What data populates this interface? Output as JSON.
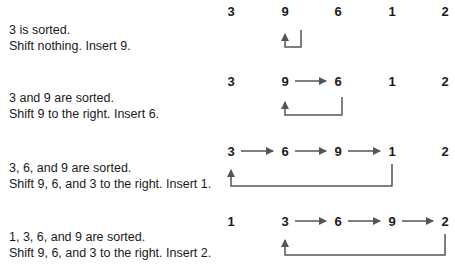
{
  "arrow_color": "#555555",
  "column_x": [
    231,
    285,
    338,
    392,
    445
  ],
  "steps": [
    {
      "line1": "3 is sorted.",
      "line2": "Shift nothing. Insert 9.",
      "values": [
        "3",
        "9",
        "6",
        "1",
        "2"
      ],
      "row_y": 4,
      "caption_y": 22,
      "shift_arrows": [],
      "insert_arrow": {
        "from_col": 1,
        "to_col": 1
      }
    },
    {
      "line1": "3 and 9 are sorted.",
      "line2": "Shift 9 to the right. Insert 6.",
      "values": [
        "3",
        "9",
        "6",
        "1",
        "2"
      ],
      "row_y": 70,
      "caption_y": 90,
      "shift_arrows": [
        [
          1,
          2
        ]
      ],
      "insert_arrow": {
        "from_col": 2,
        "to_col": 1
      }
    },
    {
      "line1": "3, 6, and 9 are sorted.",
      "line2": "Shift 9, 6, and 3 to the right. Insert 1.",
      "values": [
        "3",
        "6",
        "9",
        "1",
        "2"
      ],
      "row_y": 139,
      "caption_y": 157,
      "shift_arrows": [
        [
          0,
          1
        ],
        [
          1,
          2
        ],
        [
          2,
          3
        ]
      ],
      "insert_arrow": {
        "from_col": 3,
        "to_col": 0
      }
    },
    {
      "line1": "1, 3, 6, and 9 are sorted.",
      "line2": "Shift 9, 6, and 3 to the right. Insert 2.",
      "values": [
        "1",
        "3",
        "6",
        "9",
        "2"
      ],
      "row_y": 209,
      "caption_y": 225,
      "shift_arrows": [
        [
          1,
          2
        ],
        [
          2,
          3
        ],
        [
          3,
          4
        ]
      ],
      "insert_arrow": {
        "from_col": 4,
        "to_col": 1
      }
    }
  ]
}
